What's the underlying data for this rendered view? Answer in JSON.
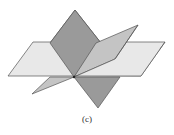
{
  "figure": {
    "caption": "(c)",
    "colors": {
      "horizontal_plane": "#e8e8e8",
      "tilted_plane": "#c4c4c4",
      "vertical_plane": "#9a9a9a",
      "edge": "#555555",
      "background": "#ffffff"
    },
    "intersection_point": [
      74,
      77
    ]
  }
}
